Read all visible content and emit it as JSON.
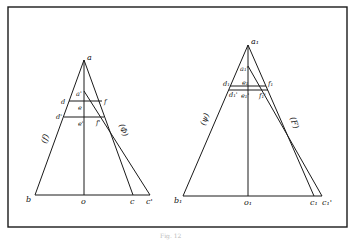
{
  "figure": {
    "caption": "Fig. 12",
    "border_color": "#1a1a1a",
    "line_color": "#1a1a1a"
  },
  "left_triangle": {
    "labels": {
      "a": "a",
      "a_prime": "a'",
      "d": "d",
      "d_prime": "d'",
      "e": "e",
      "e_prime": "e'",
      "f": "f",
      "f_prime": "f'",
      "b": "b",
      "o": "o",
      "c": "c",
      "c_prime": "c'"
    },
    "function_labels": {
      "left": "(f)",
      "right": "(Φ)"
    }
  },
  "right_triangle": {
    "labels": {
      "a": "a₁",
      "a_prime": "a₁'",
      "d": "d₁",
      "d_prime": "d₁'",
      "e": "e₁",
      "e_prime": "e₁'",
      "f": "f₁",
      "f_prime": "f₁'",
      "b": "b₁",
      "o": "o₁",
      "c": "c₁",
      "c_prime": "c₁'"
    },
    "function_labels": {
      "left": "(ψ)",
      "right": "(F)"
    }
  }
}
